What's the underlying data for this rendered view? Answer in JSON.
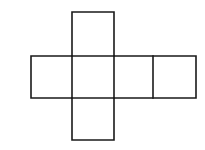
{
  "figure": {
    "panel_label": "(a)",
    "background_color": "#ffffff",
    "stroke_color": "#1a1a1a",
    "fill_color": "#ffffff",
    "stroke_width": 1.6,
    "geometry": {
      "cell_size": 42,
      "grid_origin_x": 31,
      "grid_origin_y": 12,
      "columns_x": [
        31,
        72,
        114,
        153,
        196
      ],
      "rows_y": [
        12,
        56,
        98,
        140
      ]
    },
    "faces": [
      {
        "name": "top-face",
        "x": 72,
        "y": 12,
        "width": 42,
        "height": 44
      },
      {
        "name": "left-face",
        "x": 31,
        "y": 56,
        "width": 41,
        "height": 42
      },
      {
        "name": "center-face",
        "x": 72,
        "y": 56,
        "width": 42,
        "height": 42
      },
      {
        "name": "right-face",
        "x": 114,
        "y": 56,
        "width": 39,
        "height": 42
      },
      {
        "name": "far-right-face",
        "x": 153,
        "y": 56,
        "width": 43,
        "height": 42
      },
      {
        "name": "bottom-face",
        "x": 72,
        "y": 98,
        "width": 42,
        "height": 42
      }
    ],
    "outline_points": "72,12 114,12 114,56 153,56 196,56 196,98 153,98 114,98 114,140 72,140 72,98 31,98 31,56 72,56 72,12",
    "inner_lines": [
      {
        "name": "divider-left-center",
        "x1": 72,
        "y1": 56,
        "x2": 72,
        "y2": 98
      },
      {
        "name": "divider-center-right",
        "x1": 114,
        "y1": 56,
        "x2": 114,
        "y2": 98
      },
      {
        "name": "divider-right-farright",
        "x1": 153,
        "y1": 56,
        "x2": 153,
        "y2": 98
      },
      {
        "name": "divider-top-center",
        "x1": 72,
        "y1": 56,
        "x2": 114,
        "y2": 56
      },
      {
        "name": "divider-center-bottom",
        "x1": 72,
        "y1": 98,
        "x2": 114,
        "y2": 98
      }
    ]
  }
}
